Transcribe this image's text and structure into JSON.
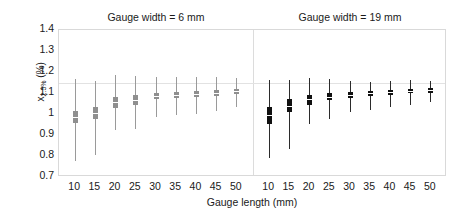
{
  "chart_data": {
    "type": "box",
    "title": "",
    "xlabel": "Gauge length (mm)",
    "ylabel": "x2.5% (%)",
    "ylabel_main": "x",
    "ylabel_sub": "2.5%",
    "ylabel_unit": " (%)",
    "ylim": [
      0.7,
      1.4
    ],
    "yticks": [
      0.7,
      0.8,
      0.9,
      1.0,
      1.1,
      1.2,
      1.3,
      1.4
    ],
    "ytick_labels": [
      "0.7",
      "0.8",
      "0.9",
      "1",
      "1.1",
      "1.2",
      "1.3",
      "1.4"
    ],
    "gridlines": [
      1.15
    ],
    "grid": true,
    "legend": "none",
    "categories": [
      10,
      15,
      20,
      25,
      30,
      35,
      40,
      45,
      50
    ],
    "xtick_labels": [
      "10",
      "15",
      "20",
      "25",
      "30",
      "35",
      "40",
      "45",
      "50"
    ],
    "panels": [
      {
        "name": "gauge-width-6mm",
        "title": "Gauge width = 6 mm",
        "color": "#8f8f8f",
        "boxes": [
          {
            "category": 10,
            "lower_whisker": 0.775,
            "q1": 0.955,
            "median": 0.985,
            "q3": 1.015,
            "upper_whisker": 1.165
          },
          {
            "category": 15,
            "lower_whisker": 0.805,
            "q1": 0.975,
            "median": 1.005,
            "q3": 1.035,
            "upper_whisker": 1.155
          },
          {
            "category": 20,
            "lower_whisker": 0.925,
            "q1": 1.03,
            "median": 1.055,
            "q3": 1.08,
            "upper_whisker": 1.185
          },
          {
            "category": 25,
            "lower_whisker": 0.93,
            "q1": 1.045,
            "median": 1.065,
            "q3": 1.09,
            "upper_whisker": 1.18
          },
          {
            "category": 30,
            "lower_whisker": 0.985,
            "q1": 1.07,
            "median": 1.085,
            "q3": 1.1,
            "upper_whisker": 1.175
          },
          {
            "category": 35,
            "lower_whisker": 0.995,
            "q1": 1.075,
            "median": 1.09,
            "q3": 1.105,
            "upper_whisker": 1.175
          },
          {
            "category": 40,
            "lower_whisker": 1.0,
            "q1": 1.08,
            "median": 1.095,
            "q3": 1.11,
            "upper_whisker": 1.175
          },
          {
            "category": 45,
            "lower_whisker": 1.015,
            "q1": 1.085,
            "median": 1.1,
            "q3": 1.115,
            "upper_whisker": 1.175
          },
          {
            "category": 50,
            "lower_whisker": 1.035,
            "q1": 1.095,
            "median": 1.108,
            "q3": 1.12,
            "upper_whisker": 1.17
          }
        ]
      },
      {
        "name": "gauge-width-19mm",
        "title": "Gauge width = 19 mm",
        "color": "#111111",
        "boxes": [
          {
            "category": 10,
            "lower_whisker": 0.79,
            "q1": 0.95,
            "median": 0.995,
            "q3": 1.035,
            "upper_whisker": 1.16
          },
          {
            "category": 15,
            "lower_whisker": 0.835,
            "q1": 1.01,
            "median": 1.04,
            "q3": 1.07,
            "upper_whisker": 1.16
          },
          {
            "category": 20,
            "lower_whisker": 0.95,
            "q1": 1.045,
            "median": 1.07,
            "q3": 1.09,
            "upper_whisker": 1.17
          },
          {
            "category": 25,
            "lower_whisker": 0.975,
            "q1": 1.065,
            "median": 1.082,
            "q3": 1.1,
            "upper_whisker": 1.165
          },
          {
            "category": 30,
            "lower_whisker": 1.01,
            "q1": 1.078,
            "median": 1.09,
            "q3": 1.103,
            "upper_whisker": 1.155
          },
          {
            "category": 35,
            "lower_whisker": 1.02,
            "q1": 1.085,
            "median": 1.098,
            "q3": 1.11,
            "upper_whisker": 1.152
          },
          {
            "category": 40,
            "lower_whisker": 1.035,
            "q1": 1.092,
            "median": 1.103,
            "q3": 1.115,
            "upper_whisker": 1.155
          },
          {
            "category": 45,
            "lower_whisker": 1.045,
            "q1": 1.098,
            "median": 1.11,
            "q3": 1.12,
            "upper_whisker": 1.16
          },
          {
            "category": 50,
            "lower_whisker": 1.055,
            "q1": 1.1,
            "median": 1.112,
            "q3": 1.122,
            "upper_whisker": 1.155
          }
        ]
      }
    ]
  }
}
